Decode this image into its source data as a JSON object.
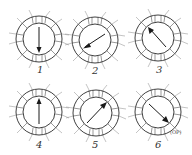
{
  "diagram": {
    "type": "rotating magnetic field sequence",
    "panels": [
      {
        "label": "1",
        "cx": 39,
        "cy": 39,
        "arrow_angle_deg": 90
      },
      {
        "label": "2",
        "cx": 95,
        "cy": 40,
        "arrow_angle_deg": 150
      },
      {
        "label": "3",
        "cx": 158,
        "cy": 38,
        "arrow_angle_deg": 230
      },
      {
        "label": "4",
        "cx": 39,
        "cy": 112,
        "arrow_angle_deg": 270
      },
      {
        "label": "5",
        "cx": 96,
        "cy": 113,
        "arrow_angle_deg": 320
      },
      {
        "label": "6",
        "cx": 158,
        "cy": 112,
        "arrow_angle_deg": 40
      }
    ],
    "annotation_panel_6": "(ОР)",
    "colors": {
      "ink": "#2a2a2a",
      "background": "#ffffff"
    }
  }
}
